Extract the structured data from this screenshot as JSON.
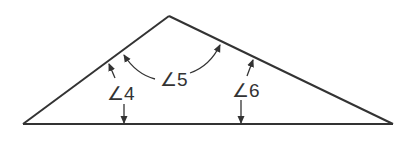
{
  "diagram": {
    "type": "geometry-triangle",
    "stroke_color": "#333333",
    "background": "#ffffff",
    "vertices": {
      "left": [
        23,
        124
      ],
      "apex": [
        169,
        16
      ],
      "right": [
        393,
        124
      ]
    },
    "angles": [
      {
        "id": "angle-4",
        "label": "∠4",
        "between": "left side and base"
      },
      {
        "id": "angle-5",
        "label": "∠5",
        "between": "left side and right side (exterior arc)"
      },
      {
        "id": "angle-6",
        "label": "∠6",
        "between": "right side and base"
      }
    ]
  }
}
